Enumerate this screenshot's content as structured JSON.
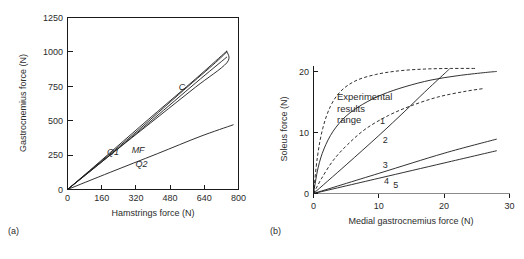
{
  "figure": {
    "panel_a_label": "(a)",
    "panel_b_label": "(b)"
  },
  "chart_data": [
    {
      "id": "panel-a",
      "type": "line",
      "title": "",
      "xlabel": "Hamstrings force (N)",
      "ylabel": "Gastrocnemius force (N)",
      "xlim": [
        0,
        800
      ],
      "ylim": [
        0,
        1250
      ],
      "xticks": [
        0,
        160,
        320,
        480,
        640,
        800
      ],
      "yticks": [
        0,
        250,
        500,
        750,
        1000,
        1250
      ],
      "xtick_labels": [
        "0",
        "160",
        "320",
        "480",
        "640",
        "800"
      ],
      "ytick_labels": [
        "0",
        "250",
        "500",
        "750",
        "1000",
        "1250"
      ],
      "grid": false,
      "box_frame": true,
      "legend_position": "inline-annotations",
      "annotations": [
        {
          "text": "C",
          "x": 520,
          "y": 720,
          "style": "italic"
        },
        {
          "text": "Q1",
          "x": 185,
          "y": 250,
          "style": "italic"
        },
        {
          "text": "MF",
          "x": 300,
          "y": 265,
          "style": "italic"
        },
        {
          "text": "Q2",
          "x": 318,
          "y": 165,
          "style": "italic"
        }
      ],
      "series": [
        {
          "name": "C",
          "style": "solid",
          "points": [
            [
              0,
              0
            ],
            [
              120,
              160
            ],
            [
              260,
              350
            ],
            [
              420,
              565
            ],
            [
              600,
              805
            ],
            [
              730,
              985
            ],
            [
              745,
              1005
            ]
          ]
        },
        {
          "name": "upper-return",
          "style": "solid",
          "points": [
            [
              745,
              1005
            ],
            [
              745,
              920
            ],
            [
              600,
              745
            ],
            [
              430,
              535
            ],
            [
              260,
              325
            ],
            [
              120,
              150
            ],
            [
              0,
              0
            ]
          ]
        },
        {
          "name": "MF",
          "style": "solid",
          "points": [
            [
              0,
              0
            ],
            [
              150,
              195
            ],
            [
              330,
              430
            ],
            [
              520,
              690
            ],
            [
              680,
              905
            ],
            [
              745,
              1000
            ]
          ]
        },
        {
          "name": "Q1",
          "style": "solid",
          "points": [
            [
              0,
              0
            ],
            [
              100,
              125
            ],
            [
              230,
              290
            ],
            [
              400,
              510
            ],
            [
              600,
              775
            ],
            [
              745,
              962
            ]
          ]
        },
        {
          "name": "Q2",
          "style": "solid",
          "points": [
            [
              0,
              0
            ],
            [
              200,
              125
            ],
            [
              420,
              260
            ],
            [
              620,
              385
            ],
            [
              775,
              470
            ]
          ]
        }
      ]
    },
    {
      "id": "panel-b",
      "type": "line",
      "title": "",
      "xlabel": "Medial gastrocnemius force (N)",
      "ylabel": "Soleus force (N)",
      "xlim": [
        0,
        30
      ],
      "ylim": [
        0,
        21
      ],
      "xticks": [
        0,
        10,
        20,
        30
      ],
      "yticks": [
        0,
        10,
        20
      ],
      "xtick_labels": [
        "0",
        "10",
        "20",
        "30"
      ],
      "ytick_labels": [
        "0",
        "10",
        "20"
      ],
      "grid": false,
      "box_frame": false,
      "legend_position": "inline-annotations",
      "annotations": [
        {
          "text": "Experimental",
          "x": 3.6,
          "y": 15.3,
          "style": "normal"
        },
        {
          "text": "results",
          "x": 3.6,
          "y": 13.4,
          "style": "normal"
        },
        {
          "text": "range",
          "x": 3.6,
          "y": 11.5,
          "style": "normal"
        },
        {
          "text": "1",
          "x": 10.2,
          "y": 11.4,
          "style": "normal"
        },
        {
          "text": "2",
          "x": 10.6,
          "y": 8.2,
          "style": "normal"
        },
        {
          "text": "3",
          "x": 10.6,
          "y": 4.1,
          "style": "normal"
        },
        {
          "text": "4",
          "x": 10.8,
          "y": 1.5,
          "style": "normal"
        },
        {
          "text": "5",
          "x": 12.2,
          "y": 0.9,
          "style": "normal"
        }
      ],
      "series": [
        {
          "name": "experimental-upper-bound",
          "style": "dashed",
          "points": [
            [
              0,
              0
            ],
            [
              0.6,
              6.0
            ],
            [
              1.4,
              10.6
            ],
            [
              2.6,
              14.3
            ],
            [
              4.2,
              16.8
            ],
            [
              6.5,
              18.5
            ],
            [
              9.5,
              19.5
            ],
            [
              13,
              20.1
            ],
            [
              17,
              20.4
            ],
            [
              21,
              20.5
            ],
            [
              25,
              20.5
            ]
          ]
        },
        {
          "name": "experimental-lower-bound",
          "style": "dashed",
          "points": [
            [
              0,
              0
            ],
            [
              1.2,
              2.4
            ],
            [
              3.0,
              5.4
            ],
            [
              5.2,
              8.0
            ],
            [
              8.0,
              10.6
            ],
            [
              11.5,
              12.8
            ],
            [
              15,
              14.4
            ],
            [
              19,
              15.8
            ],
            [
              23,
              16.7
            ],
            [
              26,
              17.2
            ]
          ]
        },
        {
          "name": "1",
          "style": "solid",
          "points": [
            [
              0,
              0
            ],
            [
              0.7,
              4.2
            ],
            [
              1.6,
              7.3
            ],
            [
              3.0,
              10.2
            ],
            [
              5.0,
              12.7
            ],
            [
              7.5,
              14.6
            ],
            [
              10.5,
              16.2
            ],
            [
              14,
              17.5
            ],
            [
              18,
              18.6
            ],
            [
              22,
              19.3
            ],
            [
              26,
              19.8
            ],
            [
              28,
              20.0
            ]
          ]
        },
        {
          "name": "2",
          "style": "solid",
          "points": [
            [
              0,
              0
            ],
            [
              5,
              4.7
            ],
            [
              10,
              9.5
            ],
            [
              14,
              13.5
            ],
            [
              17,
              16.6
            ],
            [
              20,
              19.6
            ],
            [
              20.8,
              20.4
            ]
          ]
        },
        {
          "name": "3",
          "style": "solid",
          "points": [
            [
              0,
              0
            ],
            [
              10,
              3.3
            ],
            [
              20,
              6.6
            ],
            [
              28,
              8.9
            ]
          ]
        },
        {
          "name": "4",
          "style": "solid",
          "points": [
            [
              0,
              0
            ],
            [
              10,
              2.5
            ],
            [
              20,
              5.0
            ],
            [
              28,
              7.0
            ]
          ]
        }
      ]
    }
  ]
}
